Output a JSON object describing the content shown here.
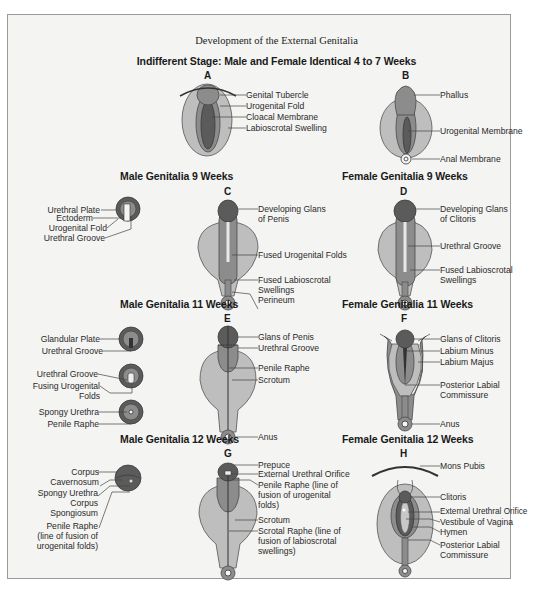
{
  "title": "Development of the External Genitalia",
  "colors": {
    "dark": "#5a5a5a",
    "mid": "#8a8a8a",
    "light": "#bdbdbd",
    "frame_bg": "#f4f4f2",
    "leader": "#444444"
  },
  "sections": {
    "indifferent": {
      "heading": "Indifferent Stage: Male and Female Identical 4 to 7 Weeks",
      "A": {
        "letter": "A",
        "labels": [
          "Genital Tubercle",
          "Urogenital Fold",
          "Cloacal Membrane",
          "Labioscrotal Swelling"
        ]
      },
      "B": {
        "letter": "B",
        "labels": [
          "Phallus",
          "Urogenital Membrane",
          "Anal Membrane"
        ]
      }
    },
    "male9": {
      "heading": "Male Genitalia 9 Weeks",
      "cross_section_labels": [
        "Urethral Plate",
        "Ectoderm",
        "Urogenital Fold",
        "Urethral Groove"
      ],
      "C": {
        "letter": "C",
        "labels": [
          "Developing Glans",
          "of Penis",
          "Fused Urogenital Folds",
          "Fused Labioscrotal",
          "Swellings",
          "Perineum"
        ]
      }
    },
    "female9": {
      "heading": "Female Genitalia 9 Weeks",
      "D": {
        "letter": "D",
        "labels": [
          "Developing Glans",
          "of Clitoris",
          "Urethral Groove",
          "Fused Labioscrotal",
          "Swellings"
        ]
      }
    },
    "male11": {
      "heading": "Male Genitalia 11 Weeks",
      "cross_section_labels": [
        "Glandular Plate",
        "Urethral Groove",
        "Urethral Groove",
        "Fusing Urogenital",
        "Folds",
        "Spongy Urethra",
        "Penile Raphe"
      ],
      "E": {
        "letter": "E",
        "labels": [
          "Glans of Penis",
          "Urethral Groove",
          "Penile Raphe",
          "Scrotum",
          "Anus"
        ]
      }
    },
    "female11": {
      "heading": "Female Genitalia 11 Weeks",
      "F": {
        "letter": "F",
        "labels": [
          "Glans of Clitoris",
          "Labium Minus",
          "Labium Majus",
          "Posterior Labial",
          "Commissure",
          "Anus"
        ]
      }
    },
    "male12": {
      "heading": "Male Genitalia 12 Weeks",
      "cross_section_labels": [
        "Corpus",
        "Cavernosum",
        "Spongy Urethra",
        "Corpus",
        "Spongiosum",
        "Penile Raphe",
        "(line of fusion of",
        "urogenital folds)"
      ],
      "G": {
        "letter": "G",
        "labels": [
          "Prepuce",
          "External Urethral Orifice",
          "Penile Raphe (line of",
          "fusion of urogenital",
          "folds)",
          "Scrotum",
          "Scrotal Raphe (line of",
          "fusion of labioscrotal",
          "swellings)"
        ]
      }
    },
    "female12": {
      "heading": "Female Genitalia 12 Weeks",
      "H": {
        "letter": "H",
        "labels": [
          "Mons Pubis",
          "Clitoris",
          "External Urethral Orifice",
          "Vestibule of Vagina",
          "Hymen",
          "Posterior Labial",
          "Commissure"
        ]
      }
    }
  }
}
